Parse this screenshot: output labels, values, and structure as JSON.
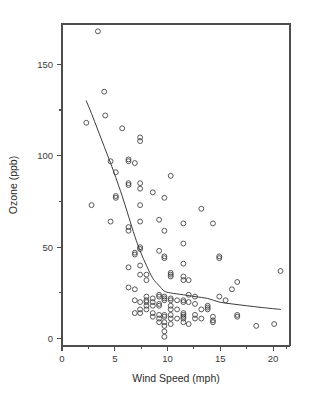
{
  "figure": {
    "background_color": "#ffffff",
    "foreground_color": "#3c3c3c",
    "width": 312,
    "height": 406
  },
  "axes": {
    "x_title": "Wind Speed (mph)",
    "y_title": "Ozone (ppb)",
    "x_ticks_major": [
      "0",
      "5",
      "10",
      "15",
      "20"
    ],
    "y_ticks_major": [
      "0",
      "50",
      "100",
      "150"
    ]
  },
  "chart_data": {
    "type": "scatter",
    "title": "",
    "xlabel": "Wind Speed (mph)",
    "ylabel": "Ozone (ppb)",
    "xlim": [
      0,
      21.6
    ],
    "ylim": [
      -4,
      172
    ],
    "x_major_ticks": [
      0,
      5,
      10,
      15,
      20
    ],
    "y_major_ticks": [
      0,
      50,
      100,
      150
    ],
    "x_minor_ticks": [
      2.5,
      7.5,
      12.5,
      17.5
    ],
    "y_minor_ticks": [
      25,
      75,
      125,
      175
    ],
    "grid": false,
    "legend": null,
    "marker": "open-circle",
    "points": [
      [
        3.4,
        168
      ],
      [
        4.0,
        135
      ],
      [
        4.1,
        122
      ],
      [
        2.3,
        118
      ],
      [
        5.7,
        115
      ],
      [
        7.4,
        110
      ],
      [
        7.4,
        108
      ],
      [
        4.6,
        97
      ],
      [
        6.3,
        97
      ],
      [
        6.9,
        96
      ],
      [
        6.3,
        98
      ],
      [
        10.3,
        89
      ],
      [
        5.1,
        91
      ],
      [
        6.3,
        85
      ],
      [
        6.3,
        84
      ],
      [
        7.4,
        85
      ],
      [
        7.4,
        82
      ],
      [
        8.6,
        80
      ],
      [
        5.1,
        78
      ],
      [
        5.1,
        77
      ],
      [
        2.8,
        73
      ],
      [
        7.4,
        73
      ],
      [
        9.7,
        77
      ],
      [
        13.2,
        71
      ],
      [
        4.6,
        64
      ],
      [
        7.4,
        64
      ],
      [
        9.2,
        65
      ],
      [
        11.5,
        63
      ],
      [
        14.3,
        63
      ],
      [
        6.3,
        61
      ],
      [
        6.3,
        59
      ],
      [
        9.7,
        59
      ],
      [
        11.5,
        52
      ],
      [
        7.4,
        50
      ],
      [
        7.4,
        49
      ],
      [
        9.2,
        48
      ],
      [
        14.9,
        44
      ],
      [
        14.9,
        45
      ],
      [
        6.9,
        47
      ],
      [
        6.9,
        46
      ],
      [
        9.7,
        45
      ],
      [
        9.7,
        44
      ],
      [
        11.5,
        41
      ],
      [
        20.7,
        37
      ],
      [
        7.4,
        40
      ],
      [
        6.3,
        39
      ],
      [
        10.3,
        36
      ],
      [
        10.3,
        35
      ],
      [
        10.3,
        34
      ],
      [
        11.5,
        34
      ],
      [
        11.5,
        32
      ],
      [
        7.4,
        35
      ],
      [
        8.0,
        35
      ],
      [
        16.6,
        31
      ],
      [
        8.0,
        32
      ],
      [
        12.0,
        32
      ],
      [
        6.3,
        28
      ],
      [
        6.9,
        27
      ],
      [
        16.1,
        27
      ],
      [
        12.0,
        24
      ],
      [
        12.6,
        23
      ],
      [
        9.2,
        23
      ],
      [
        9.2,
        24
      ],
      [
        9.7,
        23
      ],
      [
        9.7,
        22
      ],
      [
        8.0,
        23
      ],
      [
        8.6,
        22
      ],
      [
        8.0,
        21
      ],
      [
        9.7,
        21
      ],
      [
        14.9,
        23
      ],
      [
        15.5,
        21
      ],
      [
        10.3,
        22
      ],
      [
        10.3,
        21
      ],
      [
        10.9,
        21
      ],
      [
        11.5,
        20
      ],
      [
        11.5,
        21
      ],
      [
        6.9,
        21
      ],
      [
        7.4,
        20
      ],
      [
        8.0,
        20
      ],
      [
        8.6,
        20
      ],
      [
        9.2,
        19
      ],
      [
        13.8,
        18
      ],
      [
        13.8,
        17
      ],
      [
        9.2,
        18
      ],
      [
        10.3,
        18
      ],
      [
        10.3,
        16
      ],
      [
        7.4,
        16
      ],
      [
        8.0,
        16
      ],
      [
        6.9,
        14
      ],
      [
        7.4,
        14
      ],
      [
        8.6,
        14
      ],
      [
        11.5,
        14
      ],
      [
        11.5,
        13
      ],
      [
        12.6,
        13
      ],
      [
        16.6,
        13
      ],
      [
        16.6,
        12
      ],
      [
        9.2,
        13
      ],
      [
        9.7,
        13
      ],
      [
        10.3,
        13
      ],
      [
        11.5,
        12
      ],
      [
        12.6,
        11
      ],
      [
        14.3,
        12
      ],
      [
        9.7,
        12
      ],
      [
        10.3,
        11
      ],
      [
        8.6,
        12
      ],
      [
        9.2,
        11
      ],
      [
        10.9,
        11
      ],
      [
        11.5,
        11
      ],
      [
        13.2,
        11
      ],
      [
        14.3,
        10
      ],
      [
        14.3,
        9
      ],
      [
        18.4,
        7
      ],
      [
        20.1,
        8
      ],
      [
        9.2,
        9
      ],
      [
        9.7,
        9
      ],
      [
        10.3,
        8
      ],
      [
        11.5,
        9
      ],
      [
        12.0,
        8
      ],
      [
        9.7,
        7
      ],
      [
        9.7,
        4
      ],
      [
        9.7,
        1
      ],
      [
        10.9,
        16
      ],
      [
        13.2,
        16
      ],
      [
        13.8,
        16
      ],
      [
        8.6,
        18
      ],
      [
        8.0,
        18
      ],
      [
        12.0,
        20
      ],
      [
        12.6,
        19
      ]
    ],
    "smooth_curve": {
      "name": "lowess",
      "points": [
        [
          2.3,
          130
        ],
        [
          2.8,
          123
        ],
        [
          3.4,
          114
        ],
        [
          4.0,
          105
        ],
        [
          4.6,
          96
        ],
        [
          5.1,
          88
        ],
        [
          5.7,
          78
        ],
        [
          6.3,
          67
        ],
        [
          6.9,
          56
        ],
        [
          7.4,
          48
        ],
        [
          8.0,
          40
        ],
        [
          8.6,
          33
        ],
        [
          9.2,
          29
        ],
        [
          9.7,
          26
        ],
        [
          10.3,
          25
        ],
        [
          11.5,
          24
        ],
        [
          12.6,
          23
        ],
        [
          13.8,
          22
        ],
        [
          14.9,
          20
        ],
        [
          16.1,
          19
        ],
        [
          17.5,
          18
        ],
        [
          19.0,
          17
        ],
        [
          20.7,
          16
        ]
      ]
    }
  }
}
